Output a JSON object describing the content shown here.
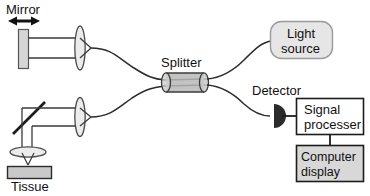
{
  "figure": {
    "background_color": "#ffffff",
    "stroke_color": "#1c1c1c",
    "fiber_color": "#2b2b2b"
  },
  "labels": {
    "mirror": "Mirror",
    "splitter": "Splitter",
    "light_source": {
      "line1": "Light",
      "line2": "source"
    },
    "detector": "Detector",
    "signal_processor": {
      "line1": "Signal",
      "line2": "processer"
    },
    "computer_display": {
      "line1": "Computer",
      "line2": "display"
    },
    "tissue": "Tissue"
  },
  "components": {
    "mirror": {
      "name": "reference-mirror",
      "shape": "vertical-bar",
      "fill": "#d6d6d6",
      "stroke": "#4a4a4a",
      "x": 18,
      "y": 29,
      "width": 11,
      "height": 40
    },
    "mirror_arrow": {
      "name": "mirror-translation-arrow",
      "shape": "double-headed-horizontal-arrow",
      "color": "#111111",
      "x1": 14,
      "x2": 34,
      "y": 21
    },
    "reference_lens": {
      "name": "reference-arm-lens",
      "shape": "vertical-ellipse",
      "fill": "#e8e8e8",
      "stroke": "#4a4a4a",
      "cx": 80,
      "cy": 48,
      "rx": 5,
      "ry": 22
    },
    "sample_lens": {
      "name": "sample-arm-collimating-lens",
      "shape": "vertical-ellipse",
      "fill": "#e8e8e8",
      "stroke": "#4a4a4a",
      "cx": 80,
      "cy": 117,
      "rx": 5,
      "ry": 19
    },
    "objective_lens": {
      "name": "objective-lens",
      "shape": "horizontal-ellipse",
      "fill": "#e8e8e8",
      "stroke": "#4a4a4a",
      "cx": 29,
      "cy": 152,
      "rx": 18,
      "ry": 5
    },
    "turning_mirror": {
      "name": "45-degree-turning-mirror",
      "shape": "diagonal-line",
      "color": "#1c1c1c",
      "x1": 14,
      "y1": 133,
      "x2": 44,
      "y2": 103
    },
    "splitter": {
      "name": "fiber-splitter",
      "shape": "cylinder",
      "fill": "#b9b9b9",
      "top_fill": "#cfcfcf",
      "stroke": "#3b3b3b",
      "x": 163,
      "y": 73,
      "width": 44,
      "height": 19
    },
    "light_source_box": {
      "name": "light-source-box",
      "shape": "rounded-rect",
      "fill": "#e6e6e6",
      "stroke": "#8e8e8e",
      "x": 270,
      "y": 21,
      "width": 62,
      "height": 37,
      "radius": 11
    },
    "detector": {
      "name": "photodetector",
      "shape": "half-disc",
      "fill": "#2b2b2b",
      "cx": 280,
      "cy": 116,
      "r": 12
    },
    "signal_processor_box": {
      "name": "signal-processor-box",
      "shape": "rect",
      "fill": "#ffffff",
      "stroke": "#1c1c1c",
      "x": 296,
      "y": 98,
      "width": 68,
      "height": 36
    },
    "computer_display_box": {
      "name": "computer-display-box",
      "shape": "rect",
      "fill": "#d8d8d8",
      "stroke": "#1c1c1c",
      "x": 296,
      "y": 145,
      "width": 68,
      "height": 36
    },
    "tissue_sample": {
      "name": "tissue-sample",
      "shape": "rect",
      "fill": "#c9c9c9",
      "stroke": "#2b2b2b",
      "x": 7,
      "y": 166,
      "width": 44,
      "height": 12
    }
  },
  "connections": [
    {
      "name": "fiber-reference-arm",
      "from": "reference-lens",
      "to": "splitter-left-upper"
    },
    {
      "name": "fiber-sample-arm",
      "from": "sample-lens",
      "to": "splitter-left-lower"
    },
    {
      "name": "fiber-source",
      "from": "splitter-right-upper",
      "to": "light-source-box"
    },
    {
      "name": "fiber-detector",
      "from": "splitter-right-lower",
      "to": "photodetector"
    },
    {
      "name": "wire-detector-to-processor",
      "from": "photodetector",
      "to": "signal-processor-box"
    },
    {
      "name": "wire-processor-to-display",
      "from": "signal-processor-box",
      "to": "computer-display-box"
    },
    {
      "name": "beam-reference-arm",
      "from": "reference-mirror",
      "to": "reference-arm-lens"
    },
    {
      "name": "beam-sample-arm",
      "from": "45-degree-turning-mirror",
      "to": "sample-arm-collimating-lens"
    },
    {
      "name": "beam-to-tissue",
      "from": "objective-lens",
      "to": "tissue-sample"
    }
  ]
}
